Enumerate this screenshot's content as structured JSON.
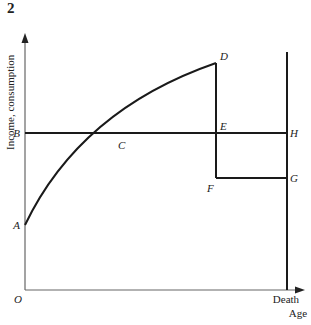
{
  "figure": {
    "number": "2",
    "y_axis_label": "Income, consumption",
    "x_axis_label": "Age",
    "x_axis_end_label": "Death",
    "origin_label": "O"
  },
  "points": {
    "A": "A",
    "B": "B",
    "C": "C",
    "D": "D",
    "E": "E",
    "F": "F",
    "G": "G",
    "H": "H"
  },
  "description": {
    "income_curve": "Concave rising income curve from A through C to D, dropping vertically at retirement from D through E to F, then flat from F to G until Death",
    "consumption_line": "Horizontal constant consumption line from B through C and E to H",
    "death_line": "Vertical line at Death through H and G down to the age axis"
  },
  "colors": {
    "line": "#1a1a1a",
    "axis": "#555555",
    "background": "#ffffff"
  }
}
